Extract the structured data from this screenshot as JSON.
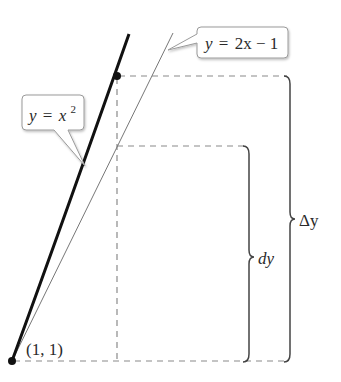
{
  "diagram": {
    "curve_label": {
      "var": "y",
      "eq": "=",
      "base": "x",
      "exp": "2"
    },
    "tangent_label": {
      "var": "y",
      "eq": "=",
      "rest": "2x − 1"
    },
    "point_label": "(1, 1)",
    "small_brace_label": "dy",
    "big_brace_label": "Δy",
    "colors": {
      "curve": "#111111",
      "tangent": "#777777",
      "dashed": "#8a8a8a",
      "brace": "#444444",
      "callout_border": "#9a9a9a"
    }
  }
}
